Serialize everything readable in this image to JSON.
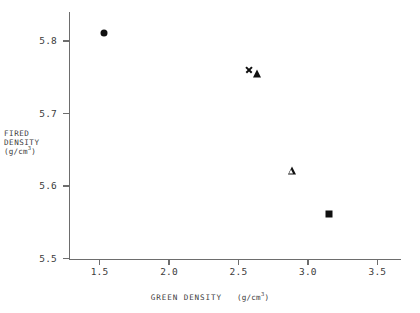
{
  "chart_data": {
    "type": "scatter",
    "title": "",
    "xlabel": "GREEN DENSITY  (g/cm3)",
    "xlabel_main": "GREEN DENSITY",
    "xlabel_unit_prefix": "(g/cm",
    "xlabel_unit_exp": "3",
    "xlabel_unit_suffix": ")",
    "ylabel": "FIRED DENSITY (g/cm3)",
    "ylabel_line1": "FIRED",
    "ylabel_line2": "DENSITY",
    "ylabel_unit_prefix": "(g/cm",
    "ylabel_unit_exp": "3",
    "ylabel_unit_suffix": ")",
    "xlim": [
      1.28,
      3.67
    ],
    "ylim": [
      5.5,
      5.84
    ],
    "xticks": [
      "1.5",
      "2.0",
      "2.5",
      "3.0",
      "3.5"
    ],
    "xtick_values": [
      1.5,
      2.0,
      2.5,
      3.0,
      3.5
    ],
    "yticks": [
      "5.5",
      "5.6",
      "5.7",
      "5.8"
    ],
    "ytick_values": [
      5.5,
      5.6,
      5.7,
      5.8
    ],
    "grid": false,
    "legend": "none",
    "frame": "left-bottom",
    "marker_color": "#101010",
    "axis_color": "#6d6d6d",
    "points": [
      {
        "name": "filled-circle",
        "marker": "circle-filled",
        "x": 1.53,
        "y": 5.811
      },
      {
        "name": "cross",
        "marker": "x-cross",
        "x": 2.575,
        "y": 5.761
      },
      {
        "name": "filled-triangle",
        "marker": "triangle-filled",
        "x": 2.63,
        "y": 5.754
      },
      {
        "name": "open-triangle",
        "marker": "triangle-open",
        "x": 2.885,
        "y": 5.621
      },
      {
        "name": "filled-square",
        "marker": "square-filled",
        "x": 3.155,
        "y": 5.561
      }
    ]
  }
}
